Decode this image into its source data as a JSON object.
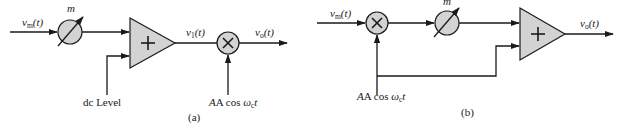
{
  "figure_a": {
    "caption": "(a)",
    "input_label": {
      "main": "v",
      "sub": "m",
      "arg": "(t)"
    },
    "attenuator_label": "m",
    "summer_symbol": "+",
    "dc_label": "dc Level",
    "intermediate_label": {
      "main": "v",
      "sub": "1",
      "arg": "(t)"
    },
    "multiplier_symbol": "×",
    "carrier_label": {
      "pre": "A cos ",
      "omega": "ω",
      "sub": "c",
      "post": "t"
    },
    "output_label": {
      "main": "v",
      "sub": "o",
      "arg": "(t)"
    }
  },
  "figure_b": {
    "caption": "(b)",
    "input_label": {
      "main": "v",
      "sub": "m",
      "arg": "(t)"
    },
    "multiplier_symbol": "×",
    "attenuator_label": "m",
    "summer_symbol": "+",
    "carrier_label": {
      "pre": "A cos ",
      "omega": "ω",
      "sub": "c",
      "post": "t"
    },
    "output_label": {
      "main": "v",
      "sub": "o",
      "arg": "(t)"
    }
  },
  "colors": {
    "stroke": "#1a1a1a",
    "block_fill": "#d3d3d3",
    "background": "#ffffff"
  }
}
